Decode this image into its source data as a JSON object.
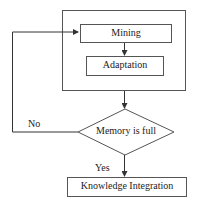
{
  "diagram": {
    "nodes": {
      "mining": "Mining",
      "adaptation": "Adaptation",
      "decision": "Memory is full",
      "integration": "Knowledge Integration"
    },
    "edges": {
      "no_label": "No",
      "yes_label": "Yes"
    }
  }
}
